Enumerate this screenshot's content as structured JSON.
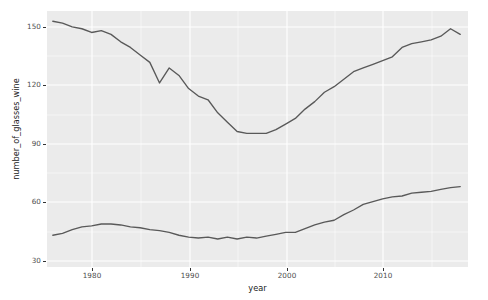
{
  "chart_data": {
    "type": "line",
    "title": "",
    "xlabel": "year",
    "ylabel": "number_of_glasses_wine",
    "xlim": [
      1976.4,
      2019.8
    ],
    "ylim": [
      21.5,
      158.5
    ],
    "xticks": [
      1980,
      1990,
      2000,
      2010
    ],
    "yticks": [
      30,
      60,
      90,
      120,
      150
    ],
    "grid": true,
    "legend_position": "none",
    "panel_background": "#ebebeb",
    "gridline_color": "#ffffff",
    "line_color": "#595959",
    "series": [
      {
        "name": "upper_series",
        "x": [
          1977,
          1978,
          1979,
          1980,
          1981,
          1982,
          1983,
          1984,
          1985,
          1986,
          1987,
          1988,
          1989,
          1990,
          1991,
          1992,
          1993,
          1994,
          1995,
          1996,
          1997,
          1998,
          1999,
          2000,
          2001,
          2002,
          2003,
          2004,
          2005,
          2006,
          2007,
          2008,
          2009,
          2010,
          2011,
          2012,
          2013,
          2014,
          2015,
          2016,
          2017,
          2018,
          2019
        ],
        "values": [
          153,
          152,
          150,
          149,
          147,
          148,
          146,
          142,
          139,
          135,
          131,
          120,
          128,
          124,
          117,
          113,
          111,
          104,
          99,
          94,
          93,
          93,
          93,
          95,
          98,
          101,
          106,
          110,
          115,
          118,
          122,
          126,
          128,
          130,
          132,
          134,
          139,
          141,
          142,
          143,
          145,
          149,
          146
        ]
      },
      {
        "name": "lower_series",
        "x": [
          1977,
          1978,
          1979,
          1980,
          1981,
          1982,
          1983,
          1984,
          1985,
          1986,
          1987,
          1988,
          1989,
          1990,
          1991,
          1992,
          1993,
          1994,
          1995,
          1996,
          1997,
          1998,
          1999,
          2000,
          2001,
          2002,
          2003,
          2004,
          2005,
          2006,
          2007,
          2008,
          2009,
          2010,
          2011,
          2012,
          2013,
          2014,
          2015,
          2016,
          2017,
          2018,
          2019
        ],
        "values": [
          38.5,
          39.5,
          41.5,
          43,
          43.5,
          44.5,
          44.5,
          44,
          43,
          42.5,
          41.5,
          41,
          40,
          38.5,
          37.5,
          37,
          37.5,
          36.5,
          37.5,
          36.5,
          37.5,
          37,
          38,
          39,
          40,
          40,
          42,
          44,
          45.5,
          46.5,
          49.5,
          52,
          55,
          56.5,
          58,
          59,
          59.5,
          61,
          61.5,
          62,
          63,
          64,
          64.5
        ]
      }
    ]
  },
  "axis": {
    "y_tick_labels": [
      "150",
      "120",
      "90",
      "60",
      "30"
    ],
    "x_tick_labels": [
      "1980",
      "1990",
      "2000",
      "2010"
    ],
    "x_title": "year",
    "y_title": "number_of_glasses_wine"
  }
}
